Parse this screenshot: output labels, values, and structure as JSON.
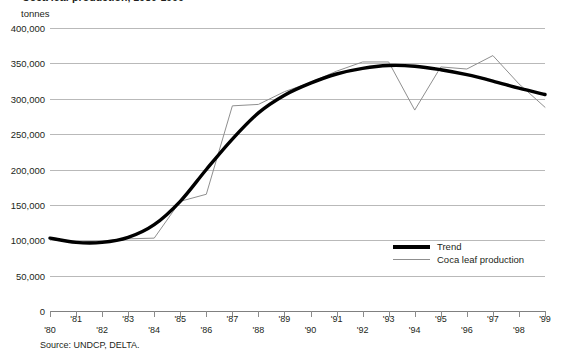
{
  "figure": {
    "title": "Coca leaf production, 1980-1999",
    "source": "Source: UNDCP, DELTA."
  },
  "axes": {
    "y_unit_label": "tonnes",
    "y_ticks": [
      "400,000",
      "350,000",
      "300,000",
      "250,000",
      "200,000",
      "150,000",
      "100,000",
      "50,000",
      "0"
    ],
    "x_ticks": [
      "'80",
      "'81",
      "'82",
      "'83",
      "'84",
      "'85",
      "'86",
      "'87",
      "'88",
      "'89",
      "'90",
      "'91",
      "'92",
      "'93",
      "'94",
      "'95",
      "'96",
      "'97",
      "'98",
      "'99"
    ]
  },
  "legend": {
    "trend_label": "Trend",
    "production_label": "Coca leaf production"
  },
  "colors": {
    "trend_line": "#000000",
    "production_line": "#8f8f8f",
    "gridline": "#b9b9b9",
    "text": "#231f20"
  },
  "chart_data": {
    "type": "line",
    "title": "Coca leaf production, 1980-1999",
    "xlabel": "",
    "ylabel": "tonnes",
    "ylim": [
      0,
      400000
    ],
    "ytick_step": 50000,
    "grid": true,
    "legend_position": "inside-right-lower",
    "x": [
      1980,
      1981,
      1982,
      1983,
      1984,
      1985,
      1986,
      1987,
      1988,
      1989,
      1990,
      1991,
      1992,
      1993,
      1994,
      1995,
      1996,
      1997,
      1998,
      1999
    ],
    "categories": [
      "'80",
      "'81",
      "'82",
      "'83",
      "'84",
      "'85",
      "'86",
      "'87",
      "'88",
      "'89",
      "'90",
      "'91",
      "'92",
      "'93",
      "'94",
      "'95",
      "'96",
      "'97",
      "'98",
      "'99"
    ],
    "series": [
      {
        "name": "Coca leaf production",
        "style": "thin-gray",
        "values": [
          103000,
          97000,
          99000,
          102000,
          103000,
          155000,
          165000,
          290000,
          292000,
          310000,
          323000,
          339000,
          352000,
          352000,
          284000,
          345000,
          342000,
          361000,
          321000,
          288000
        ]
      },
      {
        "name": "Trend",
        "style": "thick-black",
        "values": [
          103000,
          97000,
          97000,
          104000,
          122000,
          155000,
          200000,
          243000,
          280000,
          305000,
          322000,
          335000,
          343000,
          347000,
          346000,
          341000,
          334000,
          325000,
          315000,
          306000
        ]
      }
    ]
  }
}
